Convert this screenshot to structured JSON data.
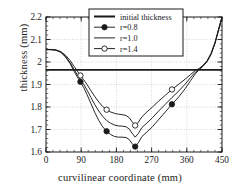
{
  "chart_data": {
    "type": "line",
    "title": "",
    "xlabel": "curvilinear coordinate (mm)",
    "ylabel": "thickness (mm)",
    "xlim": [
      0,
      450
    ],
    "ylim": [
      1.6,
      2.2
    ],
    "xticks": [
      "0",
      "90",
      "180",
      "270",
      "360",
      "450"
    ],
    "xtick_values": [
      0,
      90,
      180,
      270,
      360,
      450
    ],
    "yticks": [
      "1.6",
      "1.7",
      "1.8",
      "1.9",
      "2",
      "2.1",
      "2.2"
    ],
    "ytick_values": [
      1.6,
      1.7,
      1.8,
      1.9,
      2.0,
      2.1,
      2.2
    ],
    "grid": true,
    "minor_ticks": true,
    "legend_position": "top-center",
    "series": [
      {
        "name": "initial thickness",
        "marker": "none",
        "style": "thick-horizontal-line",
        "constant_value": 1.965,
        "x": [
          0,
          450
        ],
        "y": [
          1.965,
          1.965
        ]
      },
      {
        "name": "r=0.8",
        "marker": "filled-circle",
        "style": "line",
        "x": [
          0,
          12,
          25,
          38,
          50,
          62,
          72,
          82,
          88,
          96,
          105,
          115,
          125,
          135,
          145,
          155,
          165,
          175,
          185,
          195,
          205,
          213,
          220,
          228,
          236,
          245,
          258,
          272,
          288,
          305,
          322,
          340,
          356,
          370,
          382,
          392,
          402,
          412,
          422,
          432,
          441,
          450
        ],
        "y": [
          2.055,
          2.055,
          2.053,
          2.043,
          2.022,
          1.992,
          1.958,
          1.928,
          1.912,
          1.888,
          1.855,
          1.815,
          1.775,
          1.74,
          1.712,
          1.692,
          1.678,
          1.669,
          1.666,
          1.666,
          1.664,
          1.655,
          1.638,
          1.624,
          1.641,
          1.668,
          1.689,
          1.712,
          1.744,
          1.778,
          1.812,
          1.846,
          1.882,
          1.918,
          1.948,
          1.966,
          1.982,
          2.002,
          2.034,
          2.082,
          2.14,
          2.2
        ],
        "markers_at": [
          88,
          155,
          228,
          322
        ]
      },
      {
        "name": "r=1.0",
        "marker": "none",
        "style": "line",
        "x": [
          0,
          12,
          25,
          38,
          50,
          62,
          72,
          82,
          88,
          96,
          105,
          115,
          125,
          135,
          145,
          155,
          165,
          175,
          185,
          195,
          205,
          213,
          220,
          228,
          236,
          245,
          258,
          272,
          288,
          305,
          322,
          340,
          356,
          370,
          382,
          392,
          402,
          412,
          422,
          432,
          441,
          450
        ],
        "y": [
          2.055,
          2.055,
          2.053,
          2.044,
          2.024,
          1.996,
          1.966,
          1.938,
          1.922,
          1.902,
          1.875,
          1.842,
          1.81,
          1.782,
          1.758,
          1.74,
          1.728,
          1.72,
          1.716,
          1.715,
          1.712,
          1.702,
          1.684,
          1.666,
          1.682,
          1.708,
          1.729,
          1.752,
          1.782,
          1.812,
          1.842,
          1.872,
          1.902,
          1.932,
          1.955,
          1.969,
          1.984,
          2.004,
          2.036,
          2.084,
          2.142,
          2.2
        ]
      },
      {
        "name": "r=1.4",
        "marker": "open-circle",
        "style": "line",
        "x": [
          0,
          12,
          25,
          38,
          50,
          62,
          72,
          82,
          88,
          96,
          105,
          115,
          125,
          135,
          145,
          155,
          165,
          175,
          185,
          195,
          205,
          213,
          220,
          228,
          236,
          245,
          258,
          272,
          288,
          305,
          322,
          340,
          356,
          370,
          382,
          392,
          402,
          412,
          422,
          432,
          441,
          450
        ],
        "y": [
          2.055,
          2.056,
          2.054,
          2.046,
          2.03,
          2.006,
          1.98,
          1.955,
          1.94,
          1.922,
          1.9,
          1.872,
          1.846,
          1.822,
          1.802,
          1.788,
          1.778,
          1.772,
          1.768,
          1.766,
          1.762,
          1.752,
          1.735,
          1.718,
          1.732,
          1.756,
          1.778,
          1.8,
          1.826,
          1.852,
          1.878,
          1.902,
          1.924,
          1.945,
          1.962,
          1.972,
          1.986,
          2.006,
          2.038,
          2.086,
          2.144,
          2.2
        ],
        "markers_at": [
          88,
          155,
          228,
          322
        ]
      }
    ],
    "legend_entries": [
      {
        "label": "initial thickness",
        "marker": "none",
        "style": "thick-line"
      },
      {
        "label": "r=0.8",
        "marker": "filled-circle",
        "style": "line"
      },
      {
        "label": "r=1.0",
        "marker": "none",
        "style": "line"
      },
      {
        "label": "r=1.4",
        "marker": "open-circle",
        "style": "line"
      }
    ],
    "colors": {
      "axis": "#1a1a1a",
      "grid": "#b9b9b9",
      "curve": "#1a1a1a",
      "background": "#ffffff"
    }
  }
}
